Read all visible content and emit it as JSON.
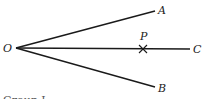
{
  "diagram": {
    "type": "geometric-construction",
    "points": {
      "O": {
        "label": "O",
        "x": 14,
        "y": 48
      },
      "A": {
        "label": "A",
        "x": 157,
        "y": 10
      },
      "B": {
        "label": "B",
        "x": 157,
        "y": 87
      },
      "C": {
        "label": "C",
        "x": 192,
        "y": 49
      },
      "P": {
        "label": "P",
        "x": 143,
        "y": 49
      }
    },
    "segments": [
      {
        "from": "O",
        "to": "A"
      },
      {
        "from": "O",
        "to": "B"
      },
      {
        "from": "O",
        "to": "C"
      }
    ],
    "marks": [
      {
        "at": "P",
        "type": "cross"
      }
    ],
    "caption": "Group I"
  }
}
